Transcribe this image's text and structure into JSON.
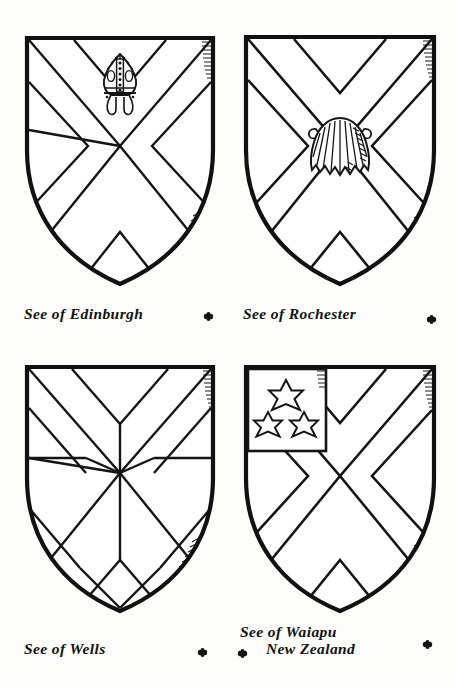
{
  "plate": {
    "background_color": "#fdfdfb",
    "ink_color": "#111111",
    "width": 454,
    "height": 685,
    "shield_count": 4
  },
  "shields": [
    {
      "id": "edinburgh",
      "name": "See of Edinburgh",
      "caption_line1": "See of Edinburgh",
      "caption_line2": "",
      "ordinary": "saltire",
      "charge": "mitre",
      "charge_name": "bishops-mitre",
      "charge_position": "in chief",
      "charge_detail": "jewelled mitre with orphrey band and two lappets",
      "hatching": "right and lower edges"
    },
    {
      "id": "rochester",
      "name": "See of Rochester",
      "caption_line1": "See of Rochester",
      "caption_line2": "",
      "ordinary": "saltire",
      "charge": "escallop",
      "charge_name": "escallop-shell",
      "charge_position": "in centre",
      "charge_detail": "scallop shell with ribbed fan and shaded flank",
      "hatching": "right and lower edges"
    },
    {
      "id": "wells",
      "name": "See of Wells",
      "caption_line1": "See of Wells",
      "caption_line2": "",
      "ordinary": "saltire and cross conjoined",
      "charge": "none",
      "charge_name": "radiating-rays",
      "charge_position": "from fess point",
      "charge_detail": "eight rays radiating from centre point",
      "hatching": "right and lower edges"
    },
    {
      "id": "waiapu",
      "name": "See of Waiapu, New Zealand",
      "caption_line1": "See of Waiapu",
      "caption_line2": "New Zealand",
      "ordinary": "saltire",
      "charge": "canton with three stars",
      "charge_name": "canton-three-mullets",
      "charge_position": "dexter chief",
      "charge_detail": "three mullets of six points, one over two",
      "star_count": 3,
      "star_points": 6,
      "hatching": "right and lower edges"
    }
  ],
  "ornaments": [
    {
      "name": "quatrefoil-separator-1",
      "glyph": "quatrefoil"
    },
    {
      "name": "quatrefoil-separator-2",
      "glyph": "quatrefoil"
    },
    {
      "name": "quatrefoil-separator-3",
      "glyph": "quatrefoil"
    },
    {
      "name": "quatrefoil-separator-4",
      "glyph": "quatrefoil"
    },
    {
      "name": "quatrefoil-separator-5",
      "glyph": "quatrefoil"
    }
  ]
}
